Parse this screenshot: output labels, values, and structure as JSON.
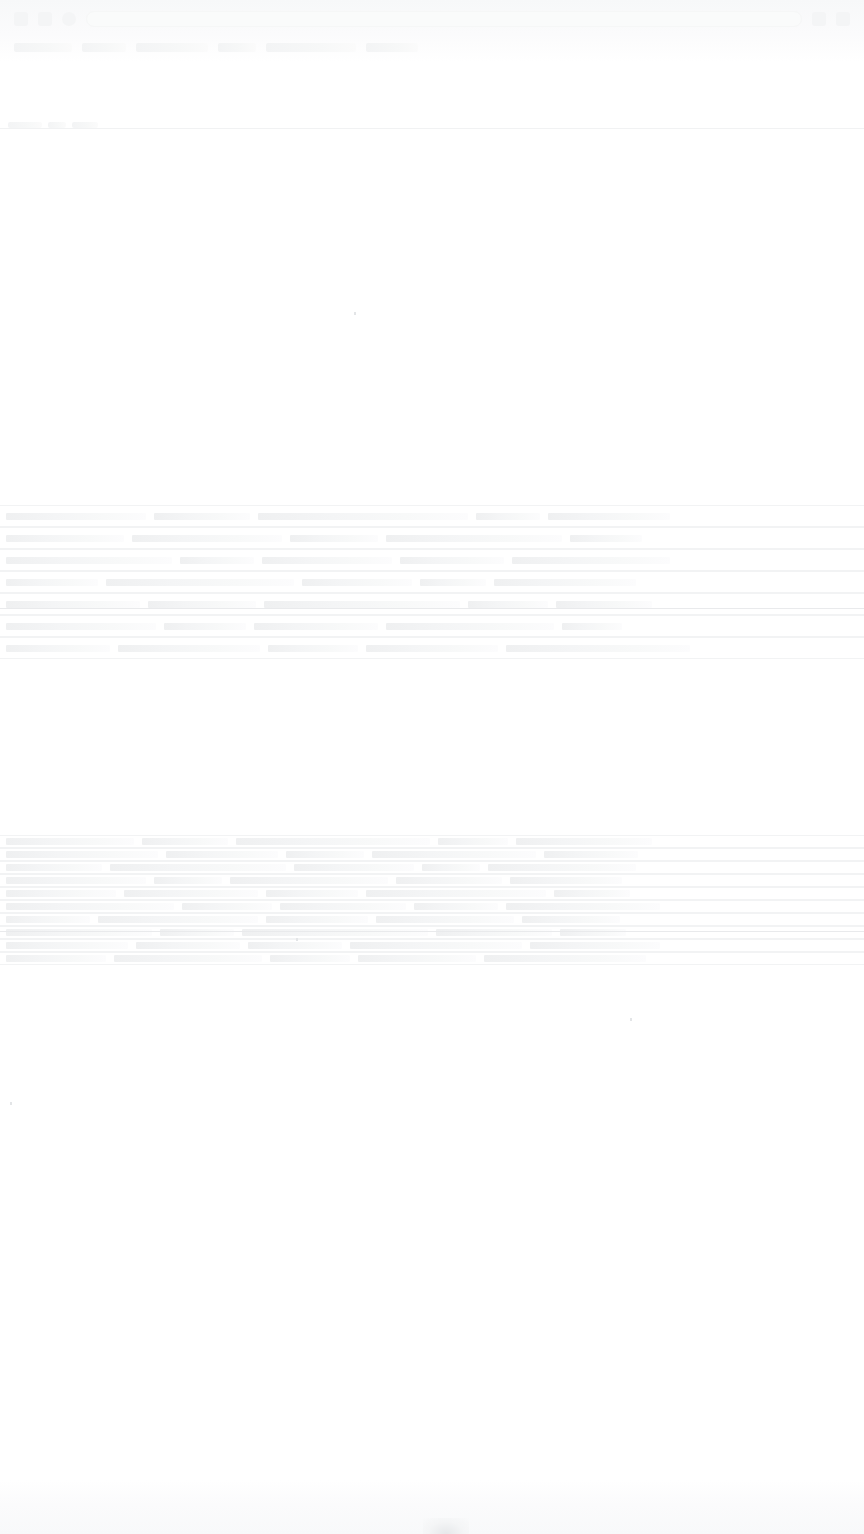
{
  "capture": {
    "width": 864,
    "height": 1534,
    "background_color": "#ffffff",
    "legibility_note": "Screenshot is almost entirely washed out to near-white; no text is legible at any zoom level. Only faint layout bands and row striations are recoverable."
  },
  "palette": {
    "page_background": "#ffffff",
    "chrome_background": "#f7f8f9",
    "ghost_text": "#f3f4f5",
    "row_streak": "#f2f3f4",
    "strong_rule": "#e9eaec",
    "footer_wash": "#f8f9fa"
  },
  "top_chrome": {
    "region": {
      "y": 0,
      "height": 62
    },
    "row_a": {
      "icons": [
        "back-icon",
        "forward-icon",
        "reload-icon"
      ],
      "field_value": "",
      "field_placeholder": "",
      "trailing_icons": [
        "star-icon",
        "menu-icon"
      ]
    },
    "row_b": {
      "items": [
        {
          "label": "",
          "width": 58
        },
        {
          "label": "",
          "width": 44
        },
        {
          "label": "",
          "width": 72
        },
        {
          "label": "",
          "width": 38
        },
        {
          "label": "",
          "width": 90
        },
        {
          "label": "",
          "width": 52
        }
      ]
    }
  },
  "chrome_divider": {
    "y": 128,
    "marks": [
      {
        "label": "",
        "width": 34
      },
      {
        "label": "",
        "width": 18
      },
      {
        "label": "",
        "width": 26
      }
    ]
  },
  "content_bands": [
    {
      "name": "band-upper",
      "y": 505,
      "height": 152,
      "row_height": 22,
      "rule_offset": 103,
      "rows": [
        {
          "cells": [
            140,
            96,
            210,
            64,
            122
          ]
        },
        {
          "cells": [
            118,
            150,
            88,
            176,
            72
          ]
        },
        {
          "cells": [
            166,
            74,
            130,
            104,
            158
          ]
        },
        {
          "cells": [
            92,
            188,
            110,
            66,
            142
          ]
        },
        {
          "cells": [
            134,
            108,
            196,
            80,
            96
          ]
        },
        {
          "cells": [
            150,
            82,
            124,
            168,
            60
          ]
        },
        {
          "cells": [
            104,
            142,
            90,
            132,
            184
          ]
        }
      ]
    },
    {
      "name": "band-lower",
      "y": 835,
      "height": 130,
      "row_height": 13,
      "rule_offset": 96,
      "rows": [
        {
          "cells": [
            128,
            86,
            194,
            70,
            136
          ]
        },
        {
          "cells": [
            152,
            112,
            78,
            164,
            94
          ]
        },
        {
          "cells": [
            96,
            176,
            120,
            58,
            148
          ]
        },
        {
          "cells": [
            140,
            68,
            158,
            106,
            112
          ]
        },
        {
          "cells": [
            110,
            134,
            92,
            180,
            76
          ]
        },
        {
          "cells": [
            168,
            90,
            126,
            84,
            154
          ]
        },
        {
          "cells": [
            84,
            160,
            102,
            138,
            98
          ]
        },
        {
          "cells": [
            146,
            74,
            186,
            116,
            66
          ]
        },
        {
          "cells": [
            122,
            104,
            94,
            172,
            130
          ]
        },
        {
          "cells": [
            100,
            148,
            80,
            118,
            162
          ]
        }
      ]
    }
  ],
  "footer": {
    "region": {
      "y": 1480,
      "height": 54
    },
    "smudge": true
  },
  "specks": [
    {
      "x": 354,
      "y": 312
    },
    {
      "x": 296,
      "y": 938
    },
    {
      "x": 10,
      "y": 1102
    },
    {
      "x": 630,
      "y": 1018
    }
  ]
}
